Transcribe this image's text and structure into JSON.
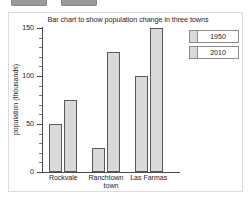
{
  "top_chips": [
    {
      "name": "toolbar-chip-left"
    },
    {
      "name": "toolbar-chip-right"
    }
  ],
  "chart_data": {
    "type": "bar",
    "title": "Bar chart to show population change in three towns",
    "xlabel": "town",
    "ylabel": "population (thousands)",
    "categories": [
      "Rockvale",
      "Ranchtown",
      "Las Farmas"
    ],
    "series": [
      {
        "name": "1950",
        "values": [
          50,
          25,
          100
        ],
        "color": "#d9d9d9"
      },
      {
        "name": "2010",
        "values": [
          75,
          125,
          150
        ],
        "color": "#d9d9d9"
      }
    ],
    "ylim": [
      0,
      150
    ],
    "y_ticks": [
      0,
      50,
      100,
      150
    ],
    "y_minor_step": 10,
    "grid": false,
    "legend_position": "right",
    "legend_entries": [
      "1950",
      "2010"
    ]
  }
}
